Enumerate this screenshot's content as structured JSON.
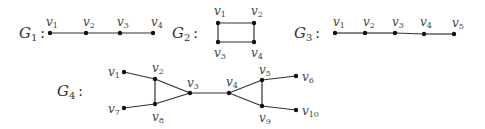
{
  "graphs": [
    {
      "id": "G1",
      "label": {
        "main": "G",
        "sub": "1",
        "colon": ":",
        "x": 19,
        "y": 38
      },
      "nodes": [
        {
          "name": "v",
          "sub": "1",
          "x": 50,
          "y": 33,
          "lx": 46,
          "ly": 26
        },
        {
          "name": "v",
          "sub": "2",
          "x": 86,
          "y": 33,
          "lx": 83,
          "ly": 26
        },
        {
          "name": "v",
          "sub": "3",
          "x": 120,
          "y": 33,
          "lx": 117,
          "ly": 26
        },
        {
          "name": "v",
          "sub": "4",
          "x": 153,
          "y": 33,
          "lx": 151,
          "ly": 26
        }
      ],
      "edges": [
        [
          0,
          1
        ],
        [
          1,
          2
        ],
        [
          2,
          3
        ]
      ]
    },
    {
      "id": "G2",
      "label": {
        "main": "G",
        "sub": "2",
        "colon": ":",
        "x": 172,
        "y": 38
      },
      "nodes": [
        {
          "name": "v",
          "sub": "1",
          "x": 218,
          "y": 23,
          "lx": 214,
          "ly": 15
        },
        {
          "name": "v",
          "sub": "2",
          "x": 254,
          "y": 23,
          "lx": 251,
          "ly": 15
        },
        {
          "name": "v",
          "sub": "3",
          "x": 218,
          "y": 42,
          "lx": 214,
          "ly": 57
        },
        {
          "name": "v",
          "sub": "4",
          "x": 254,
          "y": 42,
          "lx": 251,
          "ly": 57
        }
      ],
      "edges": [
        [
          0,
          1
        ],
        [
          1,
          3
        ],
        [
          3,
          2
        ],
        [
          2,
          0
        ]
      ]
    },
    {
      "id": "G3",
      "label": {
        "main": "G",
        "sub": "3",
        "colon": ":",
        "x": 294,
        "y": 38
      },
      "nodes": [
        {
          "name": "v",
          "sub": "1",
          "x": 335,
          "y": 33,
          "lx": 333,
          "ly": 26
        },
        {
          "name": "v",
          "sub": "2",
          "x": 365,
          "y": 33,
          "lx": 363,
          "ly": 26
        },
        {
          "name": "v",
          "sub": "3",
          "x": 395,
          "y": 33,
          "lx": 392,
          "ly": 26
        },
        {
          "name": "v",
          "sub": "4",
          "x": 424,
          "y": 34,
          "lx": 420,
          "ly": 26
        },
        {
          "name": "v",
          "sub": "5",
          "x": 454,
          "y": 34,
          "lx": 452,
          "ly": 27
        }
      ],
      "edges": [
        [
          0,
          1
        ],
        [
          1,
          2
        ],
        [
          2,
          3
        ],
        [
          3,
          4
        ]
      ]
    },
    {
      "id": "G4",
      "label": {
        "main": "G",
        "sub": "4",
        "colon": ":",
        "x": 57,
        "y": 96
      },
      "nodes": [
        {
          "name": "v",
          "sub": "1",
          "x": 124,
          "y": 72,
          "lx": 108,
          "ly": 76
        },
        {
          "name": "v",
          "sub": "2",
          "x": 155,
          "y": 79,
          "lx": 152,
          "ly": 72
        },
        {
          "name": "v",
          "sub": "3",
          "x": 190,
          "y": 93,
          "lx": 187,
          "ly": 87
        },
        {
          "name": "v",
          "sub": "4",
          "x": 229,
          "y": 93,
          "lx": 226,
          "ly": 86
        },
        {
          "name": "v",
          "sub": "5",
          "x": 262,
          "y": 80,
          "lx": 259,
          "ly": 74
        },
        {
          "name": "v",
          "sub": "6",
          "x": 296,
          "y": 76,
          "lx": 302,
          "ly": 81
        },
        {
          "name": "v",
          "sub": "7",
          "x": 124,
          "y": 108,
          "lx": 108,
          "ly": 113
        },
        {
          "name": "v",
          "sub": "8",
          "x": 155,
          "y": 104,
          "lx": 152,
          "ly": 121
        },
        {
          "name": "v",
          "sub": "9",
          "x": 262,
          "y": 106,
          "lx": 259,
          "ly": 122
        },
        {
          "name": "v",
          "sub": "10",
          "x": 296,
          "y": 110,
          "lx": 302,
          "ly": 115
        }
      ],
      "edges": [
        [
          0,
          1
        ],
        [
          1,
          2
        ],
        [
          1,
          7
        ],
        [
          6,
          7
        ],
        [
          7,
          2
        ],
        [
          2,
          3
        ],
        [
          3,
          4
        ],
        [
          3,
          8
        ],
        [
          4,
          8
        ],
        [
          4,
          5
        ],
        [
          8,
          9
        ]
      ]
    }
  ],
  "style": {
    "edge_color": "#333333",
    "node_color": "#111111",
    "label_color": "#444444"
  }
}
